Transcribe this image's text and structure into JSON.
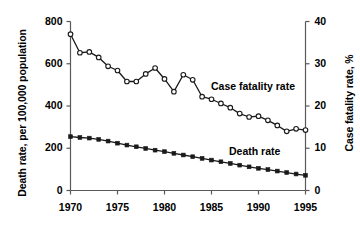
{
  "chart_data": {
    "type": "line",
    "title": "",
    "xlabel": "",
    "x": [
      1970,
      1971,
      1972,
      1973,
      1974,
      1975,
      1976,
      1977,
      1978,
      1979,
      1980,
      1981,
      1982,
      1983,
      1984,
      1985,
      1986,
      1987,
      1988,
      1989,
      1990,
      1991,
      1992,
      1993,
      1994,
      1995
    ],
    "xlim": [
      1970,
      1995
    ],
    "xticks": [
      1970,
      1975,
      1980,
      1985,
      1990,
      1995
    ],
    "xticklabels": [
      "1970",
      "1975",
      "1980",
      "1985",
      "1990",
      "1995"
    ],
    "grid": false,
    "legend_position": "inline-annotation",
    "axes": [
      {
        "id": "left",
        "ylabel": "Death rate, per 100,000 population",
        "ylim": [
          0,
          800
        ],
        "yticks": [
          0,
          200,
          400,
          600,
          800
        ],
        "yticklabels": [
          "0",
          "200",
          "400",
          "600",
          "800"
        ]
      },
      {
        "id": "right",
        "ylabel": "Case fatality rate, %",
        "ylim": [
          0,
          40
        ],
        "yticks": [
          0,
          10,
          20,
          30,
          40
        ],
        "yticklabels": [
          "0",
          "10",
          "20",
          "30",
          "40"
        ]
      }
    ],
    "series": [
      {
        "name": "Case fatality rate",
        "axis": "right",
        "units": "%",
        "marker": "open-circle",
        "annotation": "Case fatality rate",
        "values": [
          37.0,
          32.6,
          32.8,
          31.5,
          29.4,
          28.4,
          25.8,
          25.8,
          27.6,
          29.0,
          26.4,
          23.4,
          27.4,
          26.2,
          22.2,
          21.6,
          20.6,
          19.6,
          18.2,
          17.4,
          17.6,
          16.6,
          15.4,
          14.0,
          14.6,
          14.3
        ]
      },
      {
        "name": "Death rate",
        "axis": "left",
        "units": "per 100,000 population",
        "marker": "filled-square",
        "annotation": "Death rate",
        "values": [
          255,
          251,
          248,
          242,
          234,
          224,
          215,
          207,
          199,
          191,
          184,
          176,
          168,
          160,
          152,
          144,
          136,
          128,
          120,
          112,
          105,
          99,
          92,
          85,
          78,
          72
        ]
      }
    ]
  },
  "labels": {
    "case_fatality_annotation": "Case fatality rate",
    "death_rate_annotation": "Death rate"
  },
  "colors": {
    "line": "#1a1a1a",
    "axis": "#595959",
    "marker_fill_open": "#ffffff",
    "marker_fill_solid": "#1a1a1a",
    "background": "#ffffff"
  }
}
